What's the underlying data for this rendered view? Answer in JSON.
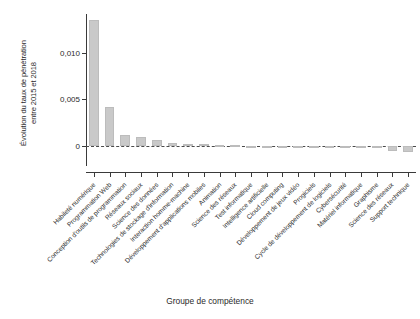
{
  "chart_data": {
    "type": "bar",
    "title": "",
    "xlabel": "Groupe de compétence",
    "ylabel": "Évolution du taux de pénétration\nentre 2015 et 2018",
    "ylim": [
      -0.0012,
      0.0142
    ],
    "ytick_values": [
      0,
      0.005,
      0.01
    ],
    "ytick_labels": [
      "0",
      "0,005",
      "0,010"
    ],
    "grid": false,
    "legend": null,
    "zero_reference_line": true,
    "categories": [
      "Habileté numérique",
      "Programmation Web",
      "Conception d'outils de programmation",
      "Réseaux sociaux",
      "Science des données",
      "Technologies de stockage d'information",
      "Interaction homme-machine",
      "Développement d'applications mobiles",
      "Animation",
      "Science des réseaux",
      "Test informatique",
      "Intelligence artificielle",
      "Cloud computing",
      "Développement de jeux vidéo",
      "Progiciels",
      "Cycle de développement de logiciels",
      "Cybersécurité",
      "Matériel informatique",
      "Graphisme",
      "Science des réseaux",
      "Support technique"
    ],
    "values": [
      0.01355,
      0.00415,
      0.00115,
      0.001,
      0.00062,
      0.00032,
      0.00022,
      0.00015,
      8e-05,
      5e-05,
      3e-05,
      2e-05,
      1e-05,
      0.0,
      0.0,
      -2e-05,
      -4e-05,
      -6e-05,
      -0.0002,
      -0.0006,
      -0.00068
    ],
    "colors": {
      "bar_fill": "#c9c9c9",
      "bar_edge": "#bcbcbc",
      "axis": "#3a3a3a",
      "text": "#2b2b2b",
      "background": "#ffffff"
    }
  }
}
